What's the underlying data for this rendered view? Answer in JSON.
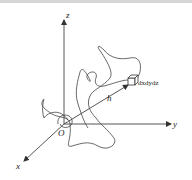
{
  "diagram": {
    "type": "3d-coordinate-system",
    "axes": {
      "x": {
        "label": "x"
      },
      "y": {
        "label": "y"
      },
      "z": {
        "label": "z"
      }
    },
    "origin_label": "O",
    "vector_label": "h",
    "volume_element_label": "dxdydz",
    "colors": {
      "line": "#333333",
      "background": "#ffffff"
    }
  }
}
